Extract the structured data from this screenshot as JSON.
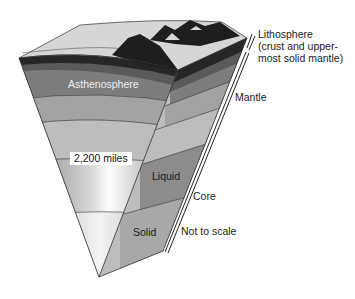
{
  "diagram": {
    "labels": {
      "asthenosphere": "Asthenosphere",
      "lithosphere_title": "Lithosphere",
      "lithosphere_line2": "(crust and upper-",
      "lithosphere_line3": "most solid mantle)",
      "mantle": "Mantle",
      "distance": "2,200 miles",
      "liquid": "Liquid",
      "core": "Core",
      "solid": "Solid",
      "note": "Not to scale"
    },
    "colors": {
      "surface": "#d4d4d4",
      "mountains": "#1e1e1e",
      "crust_dark": "#262626",
      "lithosphere_band": "#6f6f6f",
      "asthenosphere": "#7d7d7d",
      "mantle_mid": "#a3a3a3",
      "mantle_low": "#bdbdbd",
      "outer_core": "#8c8c8c",
      "inner_core": "#b5b5b5",
      "outline": "#333333"
    }
  }
}
